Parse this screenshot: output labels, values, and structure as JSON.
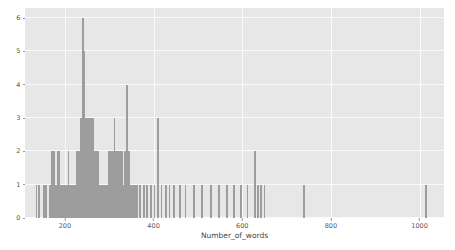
{
  "chart_data": {
    "type": "bar",
    "title": "",
    "subtitle": "",
    "xlabel": "Number_of_words",
    "ylabel": "",
    "xlim": [
      110,
      1055
    ],
    "ylim": [
      0,
      6.3
    ],
    "xticks": [
      200,
      400,
      600,
      800,
      1000
    ],
    "xtick_labels": [
      "200",
      "400",
      "600",
      "800",
      "1000"
    ],
    "yticks": [
      0,
      1,
      2,
      3,
      4,
      5,
      6
    ],
    "ytick_labels": [
      "0",
      "1",
      "2",
      "3",
      "4",
      "5",
      "6"
    ],
    "grid": true,
    "legend": null,
    "bar_color": "#9d9d9d",
    "plot_background": "#e7e7e7",
    "figure_background": "#ffffff",
    "gridline_color": "#fafafa",
    "bin_width": 4,
    "categories": [
      136,
      141,
      152,
      158,
      166,
      171,
      176,
      180,
      184,
      188,
      192,
      196,
      200,
      204,
      208,
      212,
      216,
      220,
      224,
      228,
      232,
      236,
      240,
      244,
      248,
      252,
      256,
      260,
      264,
      268,
      272,
      276,
      280,
      284,
      288,
      292,
      296,
      300,
      304,
      308,
      312,
      316,
      320,
      324,
      328,
      332,
      336,
      340,
      344,
      348,
      352,
      356,
      360,
      364,
      370,
      378,
      386,
      394,
      402,
      410,
      418,
      428,
      436,
      446,
      460,
      472,
      492,
      510,
      530,
      548,
      566,
      582,
      598,
      612,
      628,
      636,
      642,
      650,
      740,
      1015
    ],
    "values": [
      1,
      1,
      1,
      1,
      1,
      2,
      2,
      1,
      2,
      2,
      1,
      1,
      1,
      1,
      2,
      1,
      1,
      1,
      1,
      2,
      2,
      3,
      6,
      5,
      3,
      3,
      3,
      3,
      3,
      2,
      2,
      2,
      1,
      1,
      1,
      1,
      1,
      2,
      2,
      2,
      3,
      2,
      2,
      2,
      2,
      1,
      2,
      4,
      2,
      1,
      1,
      1,
      1,
      1,
      1,
      1,
      1,
      1,
      1,
      3,
      1,
      1,
      1,
      1,
      1,
      1,
      1,
      1,
      1,
      1,
      1,
      1,
      1,
      1,
      2,
      1,
      1,
      1,
      1,
      1
    ],
    "notes": {
      "max_count": 6,
      "max_count_bin": 240,
      "n_bars": 80,
      "distribution": "right-skewed histogram of word counts"
    }
  }
}
